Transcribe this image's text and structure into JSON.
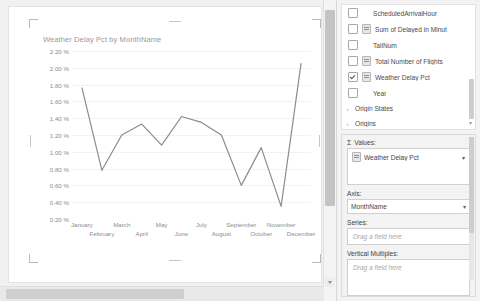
{
  "chart_data": {
    "type": "line",
    "title": "Weather Delay Pct by MonthName",
    "xlabel": "",
    "ylabel": "",
    "categories": [
      "January",
      "February",
      "March",
      "April",
      "May",
      "June",
      "July",
      "August",
      "September",
      "October",
      "November",
      "December"
    ],
    "values": [
      1.76,
      0.78,
      1.2,
      1.33,
      1.08,
      1.42,
      1.35,
      1.2,
      0.6,
      1.05,
      0.35,
      2.05
    ],
    "ytick_labels": [
      "2.20 %",
      "2.00 %",
      "1.80 %",
      "1.60 %",
      "1.40 %",
      "1.20 %",
      "1.00 %",
      "0.80 %",
      "0.60 %",
      "0.40 %",
      "0.20 %"
    ],
    "ytick_values": [
      2.2,
      2.0,
      1.8,
      1.6,
      1.4,
      1.2,
      1.0,
      0.8,
      0.6,
      0.4,
      0.2
    ],
    "ylim": [
      0.2,
      2.2
    ],
    "grid": true,
    "legend": false,
    "series_color": "#8c8c8c",
    "gridline_color": "#f2f2f2"
  },
  "pane": {
    "field_list": [
      {
        "label": "ScheduledArrivalHour",
        "checked": false,
        "has_sigma": false
      },
      {
        "label": "Sum of Delayed in Minut",
        "checked": false,
        "has_sigma": true
      },
      {
        "label": "TailNum",
        "checked": false,
        "has_sigma": false
      },
      {
        "label": "Total Number of Flights",
        "checked": false,
        "has_sigma": true
      },
      {
        "label": "Weather Delay Pct",
        "checked": true,
        "has_sigma": true
      },
      {
        "label": "Year",
        "checked": false,
        "has_sigma": false
      }
    ],
    "tree_items": [
      {
        "label": "Origin States",
        "chevron": "›"
      },
      {
        "label": "Origins",
        "chevron": "›"
      }
    ],
    "list_more_icon": "▾",
    "areas": {
      "values_label": "Values:",
      "values_sigma": "Σ",
      "values_items": [
        {
          "label": "Weather Delay Pct",
          "caret": "▾"
        }
      ],
      "axis_label": "Axis:",
      "axis_value": "MonthName",
      "axis_caret": "▾",
      "series_label": "Series:",
      "series_placeholder": "Drag a field here",
      "vertical_multiples_label": "Vertical Multiples:",
      "vertical_multiples_placeholder": "Drag a field here"
    }
  }
}
